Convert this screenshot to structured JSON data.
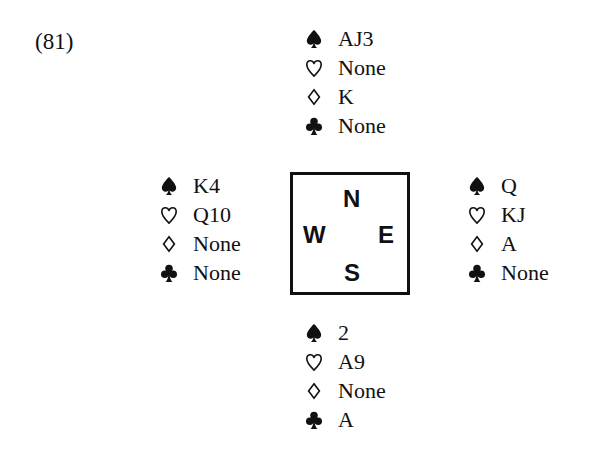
{
  "problem": {
    "number": "(81)"
  },
  "suit_icons": {
    "spades": "spade-icon (filled ♠)",
    "hearts": "heart-icon (outline ♡)",
    "diamonds": "diamond-icon (outline ◊)",
    "clubs": "club-icon (filled ♣)"
  },
  "hands": {
    "north": {
      "spades": "AJ3",
      "hearts": "None",
      "diamonds": "K",
      "clubs": "None"
    },
    "west": {
      "spades": "K4",
      "hearts": "Q10",
      "diamonds": "None",
      "clubs": "None"
    },
    "east": {
      "spades": "Q",
      "hearts": "KJ",
      "diamonds": "A",
      "clubs": "None"
    },
    "south": {
      "spades": "2",
      "hearts": "A9",
      "diamonds": "None",
      "clubs": "A"
    }
  },
  "compass": {
    "north": "N",
    "west": "W",
    "east": "E",
    "south": "S"
  }
}
